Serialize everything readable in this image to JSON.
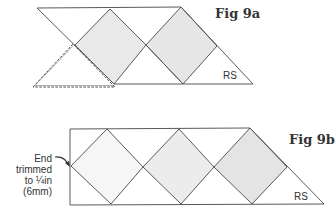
{
  "figures": [
    {
      "id": "fig-9a",
      "title": "Fig 9a",
      "side_label": "RS",
      "colors": {
        "stroke": "#5a5a5a",
        "diamond_fill": "#e8e8e8",
        "dashed": "#444444"
      }
    },
    {
      "id": "fig-9b",
      "title": "Fig 9b",
      "side_label": "RS",
      "annotation": {
        "lines": [
          "End",
          "trimmed",
          "to ¼in",
          "(6mm)"
        ]
      },
      "colors": {
        "stroke": "#5a5a5a",
        "diamond_fill_1": "#f6f6f6",
        "diamond_fill_2": "#ececec",
        "diamond_fill_3": "#e4e4e4"
      }
    }
  ]
}
